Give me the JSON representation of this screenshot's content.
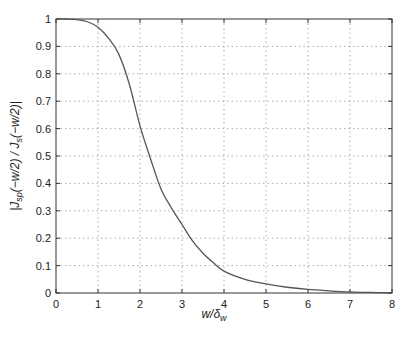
{
  "chart_data": {
    "type": "line",
    "title": "",
    "xlabel": "w/δ_w",
    "xlabel_main": "w/δ",
    "xlabel_sub": "w",
    "ylabel": "|J_sp(−w/2)/J_s(−w/2)|",
    "ylabel_parts": {
      "a": "|J",
      "a_sub": "sp",
      "b": "(−w/2) / J",
      "b_sub": "s",
      "c": "(−w/2)|"
    },
    "xlim": [
      0,
      8
    ],
    "ylim": [
      0,
      1
    ],
    "xticks": [
      0,
      1,
      2,
      3,
      4,
      5,
      6,
      7,
      8
    ],
    "xtick_labels": [
      "0",
      "1",
      "2",
      "3",
      "4",
      "5",
      "6",
      "7",
      "8"
    ],
    "yticks": [
      0,
      0.1,
      0.2,
      0.3,
      0.4,
      0.5,
      0.6,
      0.7,
      0.8,
      0.9,
      1
    ],
    "ytick_labels": [
      "0",
      "0.1",
      "0.2",
      "0.3",
      "0.4",
      "0.5",
      "0.6",
      "0.7",
      "0.8",
      "0.9",
      "1"
    ],
    "grid": true,
    "legend": null,
    "series": [
      {
        "name": "ratio",
        "color": "#555555",
        "x": [
          0,
          0.25,
          0.5,
          0.75,
          1.0,
          1.25,
          1.5,
          1.75,
          2.0,
          2.25,
          2.5,
          2.75,
          3.0,
          3.25,
          3.5,
          3.75,
          4.0,
          4.5,
          5.0,
          5.5,
          6.0,
          6.5,
          7.0,
          7.5,
          8.0
        ],
        "y": [
          1.0,
          1.0,
          0.998,
          0.99,
          0.97,
          0.93,
          0.87,
          0.76,
          0.61,
          0.49,
          0.38,
          0.31,
          0.25,
          0.19,
          0.145,
          0.11,
          0.08,
          0.05,
          0.033,
          0.021,
          0.013,
          0.008,
          0.004,
          0.002,
          0.001
        ]
      }
    ]
  }
}
